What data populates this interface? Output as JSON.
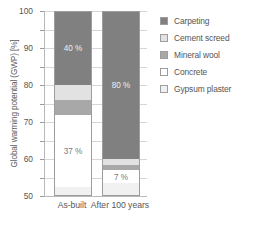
{
  "chart_data": {
    "type": "bar",
    "stacked": true,
    "title": "",
    "xlabel": "",
    "ylabel": "Global warming potential (GWP) [%]",
    "ylim": [
      0,
      100
    ],
    "yticks": [
      0,
      10,
      20,
      30,
      40,
      50,
      60,
      70,
      80,
      90,
      100
    ],
    "grid": true,
    "legend_position": "right",
    "categories": [
      "As-built",
      "After 100 years"
    ],
    "series": [
      {
        "name": "Carpeting",
        "color": "#808080",
        "values": [
          40,
          80
        ]
      },
      {
        "name": "Cement screed",
        "color": "#e2e2e2",
        "values": [
          8,
          3
        ]
      },
      {
        "name": "Mineral wool",
        "color": "#a8a8a8",
        "values": [
          8,
          3
        ]
      },
      {
        "name": "Concrete",
        "color": "#ffffff",
        "values": [
          39,
          7
        ]
      },
      {
        "name": "Gypsum plaster",
        "color": "#f1f1f1",
        "values": [
          5,
          7
        ]
      }
    ],
    "data_labels": [
      {
        "category": "As-built",
        "series": "Carpeting",
        "text": "40 %"
      },
      {
        "category": "As-built",
        "series": "Concrete",
        "text": "37 %"
      },
      {
        "category": "After 100 years",
        "series": "Carpeting",
        "text": "80 %"
      },
      {
        "category": "After 100 years",
        "series": "Concrete",
        "text": "7 %"
      }
    ]
  },
  "legend": {
    "items": [
      {
        "label": "Carpeting"
      },
      {
        "label": "Cement screed"
      },
      {
        "label": "Mineral wool"
      },
      {
        "label": "Concrete"
      },
      {
        "label": "Gypsum plaster"
      }
    ]
  },
  "axes": {
    "y_title": "Global warming potential (GWP) [%]",
    "y_ticks": [
      "0",
      "10",
      "20",
      "30",
      "40",
      "50",
      "60",
      "70",
      "80",
      "90",
      "100"
    ],
    "x_ticks": [
      "As-built",
      "After 100 years"
    ]
  }
}
